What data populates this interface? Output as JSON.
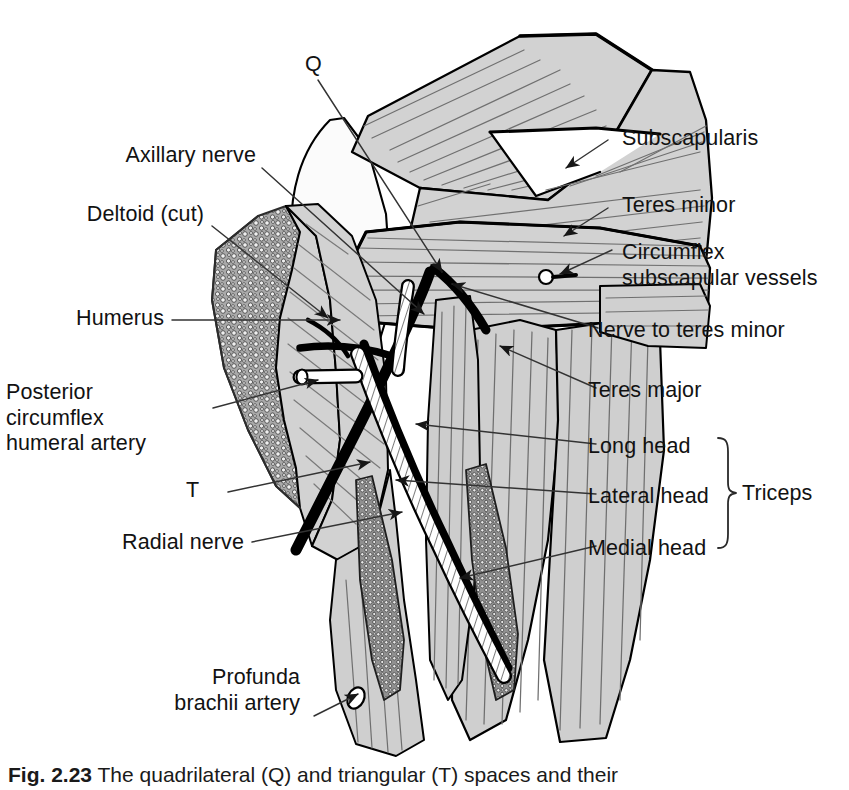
{
  "figure": {
    "caption_prefix": "Fig. 2.23",
    "caption_text": "The quadrilateral (Q) and triangular (T) spaces and their"
  },
  "markers": [
    {
      "id": "q",
      "label": "Q",
      "meaning": "quadrilateral space"
    },
    {
      "id": "t",
      "label": "T",
      "meaning": "triangular space"
    }
  ],
  "labels_left": [
    {
      "id": "axillary-nerve",
      "text": "Axillary nerve"
    },
    {
      "id": "deltoid-cut",
      "text": "Deltoid (cut)"
    },
    {
      "id": "humerus",
      "text": "Humerus"
    },
    {
      "id": "posterior-circumflex",
      "line1": "Posterior",
      "line2": "circumflex",
      "line3": "humeral artery"
    },
    {
      "id": "radial-nerve",
      "text": "Radial nerve"
    },
    {
      "id": "profunda-brachii",
      "line1": "Profunda",
      "line2": "brachii artery"
    }
  ],
  "labels_right": [
    {
      "id": "subscapularis",
      "text": "Subscapularis"
    },
    {
      "id": "teres-minor",
      "text": "Teres minor"
    },
    {
      "id": "circumflex-subscapular",
      "line1": "Circumflex",
      "line2": "subscapular vessels"
    },
    {
      "id": "nerve-to-teres-minor",
      "text": "Nerve to teres minor"
    },
    {
      "id": "teres-major",
      "text": "Teres major"
    },
    {
      "id": "long-head",
      "text": "Long head"
    },
    {
      "id": "lateral-head",
      "text": "Lateral head"
    },
    {
      "id": "medial-head",
      "text": "Medial head"
    }
  ],
  "brace": {
    "id": "triceps-brace",
    "text": "Triceps"
  },
  "colors": {
    "background": "#ffffff",
    "muscle_fill": "#d2d2d2",
    "muscle_fill_alt": "#cacaca",
    "bone_fill": "#efefef",
    "outline": "#000000",
    "striation": "#6e6e6e",
    "nerve_black": "#000000",
    "artery_white": "#ffffff",
    "cut_border": "#8a8a8a",
    "leader_line": "#3a3a3a",
    "text": "#121212"
  }
}
